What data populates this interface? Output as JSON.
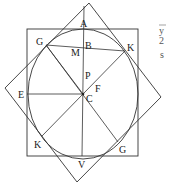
{
  "diagram": {
    "labels": {
      "A": "A",
      "G_top": "G",
      "B": "B",
      "M": "M",
      "K_top": "K",
      "P": "P",
      "F": "F",
      "E": "E",
      "C": "C",
      "K_bottom": "K",
      "G_bottom": "G",
      "V": "V"
    },
    "side_text": {
      "numerator": "y",
      "denominator": "2",
      "letter": "s"
    },
    "colors": {
      "stroke": "#333333",
      "background": "#ffffff"
    }
  }
}
